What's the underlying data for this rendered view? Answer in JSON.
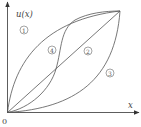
{
  "figure": {
    "y_axis_label": "u(x)",
    "x_axis_label": "x",
    "origin_label": "0",
    "regions": [
      {
        "id": "1",
        "label": "1",
        "cx": 24,
        "cy": 30
      },
      {
        "id": "2",
        "label": "2",
        "cx": 88,
        "cy": 51
      },
      {
        "id": "3",
        "label": "3",
        "cx": 110,
        "cy": 73
      },
      {
        "id": "4",
        "label": "4",
        "cx": 52,
        "cy": 50
      }
    ],
    "curves": [
      {
        "name": "concave-curve",
        "region": "1"
      },
      {
        "name": "linear-diagonal",
        "region": "2"
      },
      {
        "name": "convex-curve",
        "region": "3"
      },
      {
        "name": "s-shaped-curve",
        "region": "4"
      }
    ],
    "colors": {
      "line": "#555555",
      "axis": "#333333"
    }
  }
}
